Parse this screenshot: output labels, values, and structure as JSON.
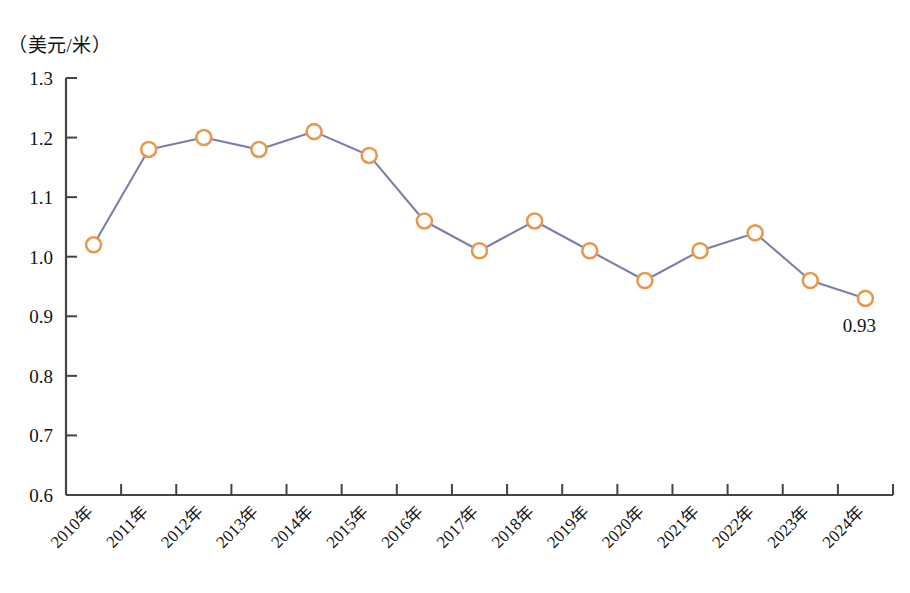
{
  "chart_data": {
    "type": "line",
    "title": "",
    "subtitle": "",
    "unit_label": "（美元/米）",
    "xlabel": "",
    "ylabel": "",
    "categories": [
      "2010年",
      "2011年",
      "2012年",
      "2013年",
      "2014年",
      "2015年",
      "2016年",
      "2017年",
      "2018年",
      "2019年",
      "2020年",
      "2021年",
      "2022年",
      "2023年",
      "2024年"
    ],
    "values": [
      1.02,
      1.18,
      1.2,
      1.18,
      1.21,
      1.17,
      1.06,
      1.01,
      1.06,
      1.01,
      0.96,
      1.01,
      1.04,
      0.96,
      0.93
    ],
    "point_labels": [
      null,
      null,
      null,
      null,
      null,
      null,
      null,
      null,
      null,
      null,
      null,
      null,
      null,
      null,
      "0.93"
    ],
    "ylim": [
      0.6,
      1.3
    ],
    "ytick_labels": [
      "1.3",
      "1.2",
      "1.1",
      "1.0",
      "0.9",
      "0.8",
      "0.7",
      "0.6"
    ],
    "ytick_values": [
      1.3,
      1.2,
      1.1,
      1.0,
      0.9,
      0.8,
      0.7,
      0.6
    ],
    "grid": false,
    "legend": "none",
    "series": [
      {
        "name": "",
        "values": [
          1.02,
          1.18,
          1.2,
          1.18,
          1.21,
          1.17,
          1.06,
          1.01,
          1.06,
          1.01,
          0.96,
          1.01,
          1.04,
          0.96,
          0.93
        ]
      }
    ],
    "colors": {
      "line": "#7b80a8",
      "marker_stroke": "#e79a4e",
      "marker_fill": "#ffffff",
      "axis": "#444444",
      "text": "#141414",
      "background": "#ffffff"
    }
  }
}
